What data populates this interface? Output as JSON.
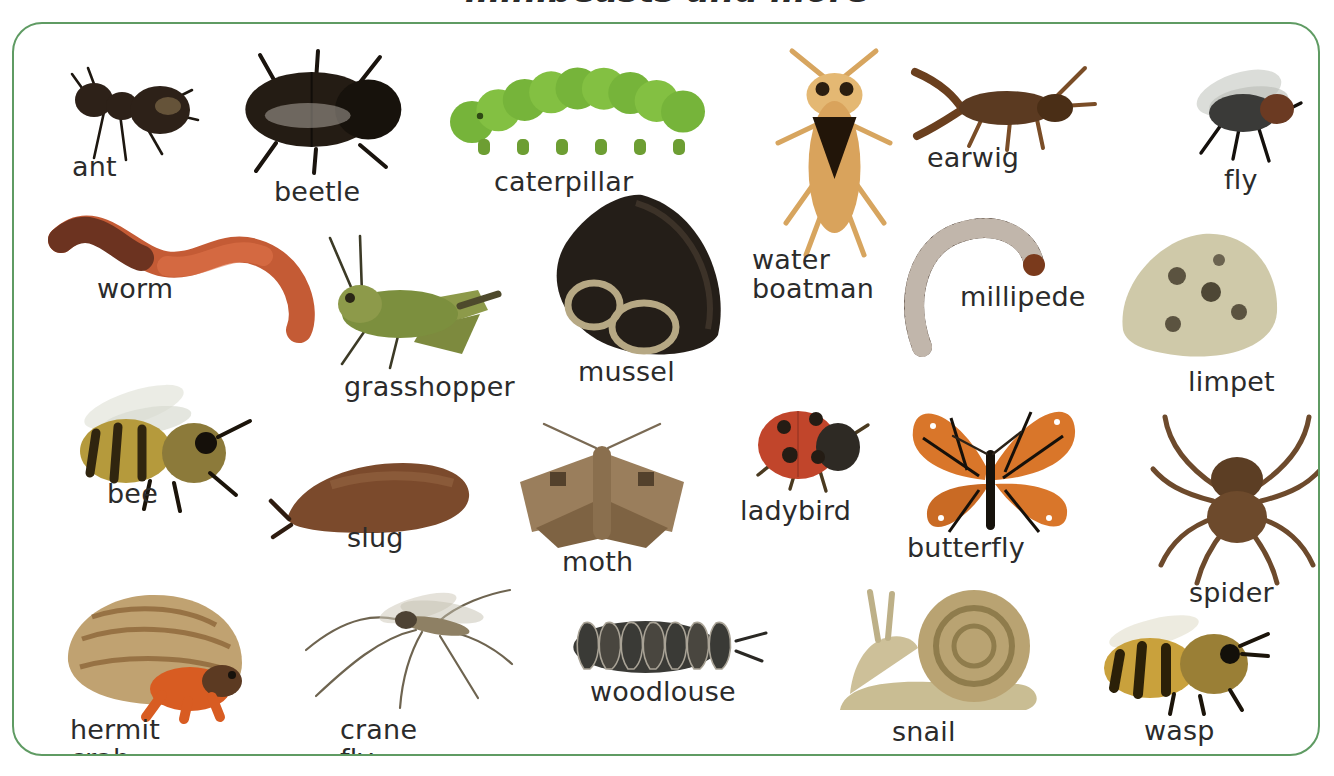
{
  "page": {
    "title_partial": "minibeasts and more",
    "background_color": "#ffffff",
    "frame_color": "#5f9b63",
    "label_color": "#2b2b2b",
    "width": 1334,
    "height": 776
  },
  "poster": {
    "kind": "picture-vocabulary-chart",
    "subject": "minibeasts / invertebrates",
    "item_count": 24,
    "items": [
      {
        "id": "ant",
        "label": "ant",
        "x": 40,
        "y": 48,
        "w": 175,
        "h": 105,
        "label_x": 70,
        "label_y": 150,
        "color": "#2d2118"
      },
      {
        "id": "beetle",
        "label": "beetle",
        "x": 218,
        "y": 45,
        "w": 195,
        "h": 125,
        "label_x": 272,
        "label_y": 175,
        "color": "#241c14"
      },
      {
        "id": "caterpillar",
        "label": "caterpillar",
        "x": 452,
        "y": 50,
        "w": 255,
        "h": 115,
        "label_x": 492,
        "label_y": 165,
        "color": "#76b43a"
      },
      {
        "id": "water-boatman",
        "label": "water\nboatman",
        "x": 770,
        "y": 45,
        "w": 125,
        "h": 210,
        "label_x": 750,
        "label_y": 243,
        "color": "#d9a35c"
      },
      {
        "id": "earwig",
        "label": "earwig",
        "x": 905,
        "y": 48,
        "w": 190,
        "h": 105,
        "label_x": 925,
        "label_y": 141,
        "color": "#5b3a21"
      },
      {
        "id": "fly",
        "label": "fly",
        "x": 1175,
        "y": 55,
        "w": 130,
        "h": 100,
        "label_x": 1222,
        "label_y": 163,
        "color": "#3a3a38"
      },
      {
        "id": "worm",
        "label": "worm",
        "x": 35,
        "y": 196,
        "w": 290,
        "h": 145,
        "label_x": 95,
        "label_y": 272,
        "color": "#c45b35"
      },
      {
        "id": "grasshopper",
        "label": "grasshopper",
        "x": 300,
        "y": 230,
        "w": 215,
        "h": 140,
        "label_x": 342,
        "label_y": 370,
        "color": "#7c8f3e"
      },
      {
        "id": "mussel",
        "label": "mussel",
        "x": 530,
        "y": 185,
        "w": 205,
        "h": 175,
        "label_x": 576,
        "label_y": 355,
        "color": "#241e18"
      },
      {
        "id": "millipede",
        "label": "millipede",
        "x": 890,
        "y": 205,
        "w": 160,
        "h": 145,
        "label_x": 958,
        "label_y": 280,
        "color": "#3a2a1e"
      },
      {
        "id": "limpet",
        "label": "limpet",
        "x": 1105,
        "y": 218,
        "w": 175,
        "h": 145,
        "label_x": 1186,
        "label_y": 365,
        "color": "#cfc9a9"
      },
      {
        "id": "bee",
        "label": "bee",
        "x": 48,
        "y": 375,
        "w": 205,
        "h": 135,
        "label_x": 105,
        "label_y": 477,
        "color": "#b59a3c"
      },
      {
        "id": "slug",
        "label": "slug",
        "x": 255,
        "y": 425,
        "w": 220,
        "h": 115,
        "label_x": 345,
        "label_y": 521,
        "color": "#7b4a2c"
      },
      {
        "id": "moth",
        "label": "moth",
        "x": 500,
        "y": 410,
        "w": 200,
        "h": 140,
        "label_x": 560,
        "label_y": 545,
        "color": "#9a7e5c"
      },
      {
        "id": "ladybird",
        "label": "ladybird",
        "x": 740,
        "y": 395,
        "w": 120,
        "h": 95,
        "label_x": 738,
        "label_y": 494,
        "color": "#c1452b"
      },
      {
        "id": "butterfly",
        "label": "butterfly",
        "x": 895,
        "y": 390,
        "w": 180,
        "h": 150,
        "label_x": 905,
        "label_y": 531,
        "color": "#d9762a"
      },
      {
        "id": "spider",
        "label": "spider",
        "x": 1145,
        "y": 405,
        "w": 175,
        "h": 170,
        "label_x": 1187,
        "label_y": 576,
        "color": "#6d4a2c"
      },
      {
        "id": "hermit-crab",
        "label": "hermit crab",
        "x": 48,
        "y": 575,
        "w": 205,
        "h": 140,
        "label_x": 68,
        "label_y": 713,
        "color": "#c0a271"
      },
      {
        "id": "crane-fly",
        "label": "crane fly",
        "x": 290,
        "y": 568,
        "w": 225,
        "h": 145,
        "label_x": 338,
        "label_y": 713,
        "color": "#8e8064"
      },
      {
        "id": "woodlouse",
        "label": "woodlouse",
        "x": 558,
        "y": 605,
        "w": 190,
        "h": 80,
        "label_x": 588,
        "label_y": 675,
        "color": "#3a3a36"
      },
      {
        "id": "snail",
        "label": "snail",
        "x": 820,
        "y": 582,
        "w": 230,
        "h": 145,
        "label_x": 890,
        "label_y": 715,
        "color": "#b9a372"
      },
      {
        "id": "wasp",
        "label": "wasp",
        "x": 1088,
        "y": 608,
        "w": 180,
        "h": 105,
        "label_x": 1142,
        "label_y": 714,
        "color": "#c9a13c"
      }
    ]
  }
}
